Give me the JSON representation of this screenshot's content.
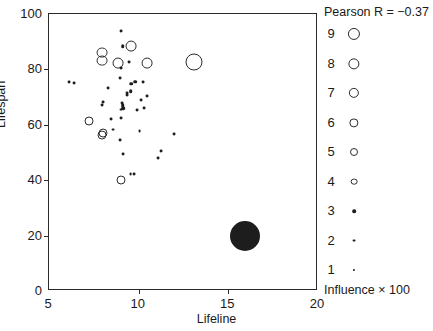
{
  "chart_data": {
    "type": "scatter",
    "title": "",
    "xlabel": "Lifeline",
    "ylabel": "Lifespan",
    "xlim": [
      5,
      20
    ],
    "ylim": [
      0,
      100
    ],
    "xticks": [
      5,
      10,
      15,
      20
    ],
    "yticks": [
      0,
      20,
      40,
      60,
      80,
      100
    ],
    "grid": false,
    "annotation": "Pearson R = −0.37",
    "pearson_r": -0.37,
    "size_encoding": "Influence × 100",
    "legend_position": "right",
    "legend_entries": [
      {
        "label": "9",
        "style": "open",
        "px": 8.5
      },
      {
        "label": "8",
        "style": "open",
        "px": 7.8
      },
      {
        "label": "7",
        "style": "open",
        "px": 7.0
      },
      {
        "label": "6",
        "style": "open",
        "px": 6.2
      },
      {
        "label": "5",
        "style": "open",
        "px": 5.2
      },
      {
        "label": "4",
        "style": "open",
        "px": 4.2
      },
      {
        "label": "3",
        "style": "filled",
        "px": 3.6
      },
      {
        "label": "2",
        "style": "filled",
        "px": 2.9
      },
      {
        "label": "1",
        "style": "filled",
        "px": 2.1
      }
    ],
    "points": [
      {
        "x": 9.0,
        "y": 94.0,
        "influence": 2,
        "style": "filled"
      },
      {
        "x": 9.1,
        "y": 88.3,
        "influence": 3,
        "style": "filled"
      },
      {
        "x": 9.6,
        "y": 88.3,
        "influence": 5,
        "style": "open"
      },
      {
        "x": 7.95,
        "y": 86.1,
        "influence": 5,
        "style": "open"
      },
      {
        "x": 7.95,
        "y": 83.2,
        "influence": 5,
        "style": "open"
      },
      {
        "x": 9.45,
        "y": 82.5,
        "influence": 2,
        "style": "filled"
      },
      {
        "x": 8.85,
        "y": 82.3,
        "influence": 5,
        "style": "open"
      },
      {
        "x": 10.45,
        "y": 82.3,
        "influence": 5,
        "style": "open"
      },
      {
        "x": 13.1,
        "y": 82.6,
        "influence": 9,
        "style": "open"
      },
      {
        "x": 9.0,
        "y": 80.4,
        "influence": 2,
        "style": "filled"
      },
      {
        "x": 6.1,
        "y": 75.5,
        "influence": 2,
        "style": "filled"
      },
      {
        "x": 6.4,
        "y": 75.0,
        "influence": 2,
        "style": "filled"
      },
      {
        "x": 8.95,
        "y": 77.0,
        "influence": 2,
        "style": "filled"
      },
      {
        "x": 9.8,
        "y": 75.6,
        "influence": 3,
        "style": "filled"
      },
      {
        "x": 9.6,
        "y": 74.8,
        "influence": 3,
        "style": "filled"
      },
      {
        "x": 10.25,
        "y": 75.5,
        "influence": 2,
        "style": "filled"
      },
      {
        "x": 8.3,
        "y": 73.3,
        "influence": 2,
        "style": "filled"
      },
      {
        "x": 9.55,
        "y": 72.1,
        "influence": 3,
        "style": "filled"
      },
      {
        "x": 9.35,
        "y": 71.5,
        "influence": 2,
        "style": "filled"
      },
      {
        "x": 9.35,
        "y": 70.8,
        "influence": 2,
        "style": "filled"
      },
      {
        "x": 10.45,
        "y": 70.3,
        "influence": 2,
        "style": "filled"
      },
      {
        "x": 10.15,
        "y": 69.0,
        "influence": 2,
        "style": "filled"
      },
      {
        "x": 8.0,
        "y": 68.3,
        "influence": 2,
        "style": "filled"
      },
      {
        "x": 7.95,
        "y": 67.2,
        "influence": 2,
        "style": "filled"
      },
      {
        "x": 9.05,
        "y": 68.0,
        "influence": 2,
        "style": "filled"
      },
      {
        "x": 9.1,
        "y": 67.1,
        "influence": 3,
        "style": "filled"
      },
      {
        "x": 9.15,
        "y": 66.0,
        "influence": 3,
        "style": "filled"
      },
      {
        "x": 9.0,
        "y": 65.5,
        "influence": 2,
        "style": "filled"
      },
      {
        "x": 9.9,
        "y": 65.4,
        "influence": 2,
        "style": "filled"
      },
      {
        "x": 10.3,
        "y": 65.9,
        "influence": 2,
        "style": "filled"
      },
      {
        "x": 8.45,
        "y": 62.1,
        "influence": 2,
        "style": "filled"
      },
      {
        "x": 7.25,
        "y": 61.2,
        "influence": 4,
        "style": "open"
      },
      {
        "x": 9.0,
        "y": 62.5,
        "influence": 2,
        "style": "filled"
      },
      {
        "x": 8.55,
        "y": 58.3,
        "influence": 2,
        "style": "filled"
      },
      {
        "x": 8.0,
        "y": 57.2,
        "influence": 4,
        "style": "open"
      },
      {
        "x": 7.95,
        "y": 56.3,
        "influence": 4,
        "style": "open"
      },
      {
        "x": 10.05,
        "y": 57.6,
        "influence": 2,
        "style": "filled"
      },
      {
        "x": 11.95,
        "y": 56.7,
        "influence": 2,
        "style": "filled"
      },
      {
        "x": 8.95,
        "y": 54.5,
        "influence": 2,
        "style": "filled"
      },
      {
        "x": 11.25,
        "y": 50.5,
        "influence": 2,
        "style": "filled"
      },
      {
        "x": 9.15,
        "y": 49.5,
        "influence": 2,
        "style": "filled"
      },
      {
        "x": 11.1,
        "y": 48.0,
        "influence": 2,
        "style": "filled"
      },
      {
        "x": 9.55,
        "y": 42.3,
        "influence": 2,
        "style": "filled"
      },
      {
        "x": 9.75,
        "y": 42.3,
        "influence": 2,
        "style": "filled"
      },
      {
        "x": 9.0,
        "y": 40.0,
        "influence": 4,
        "style": "open"
      },
      {
        "x": 15.95,
        "y": 20.0,
        "influence": 9,
        "style": "bigfilled"
      }
    ]
  },
  "axes": {
    "y_ticklabels": [
      "100",
      "80",
      "60",
      "40",
      "20",
      "0"
    ],
    "x_ticklabels": [
      "5",
      "10",
      "15",
      "20"
    ]
  }
}
